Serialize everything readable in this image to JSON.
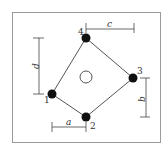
{
  "diagram": {
    "type": "bolt-pattern",
    "frame": {
      "x": 12,
      "y": 12,
      "w": 149,
      "h": 131,
      "stroke": "#9a9a9a"
    },
    "center_hole": {
      "cx": 86,
      "cy": 77,
      "r": 6
    },
    "bolts": [
      {
        "id": "1",
        "label": "1",
        "cx": 52,
        "cy": 94
      },
      {
        "id": "2",
        "label": "2",
        "cx": 86,
        "cy": 117
      },
      {
        "id": "3",
        "label": "3",
        "cx": 133,
        "cy": 78
      },
      {
        "id": "4",
        "label": "4",
        "cx": 86,
        "cy": 38
      }
    ],
    "dimensions": {
      "a": {
        "label": "a"
      },
      "b": {
        "label": "b"
      },
      "c": {
        "label": "c"
      },
      "d": {
        "label": "d"
      }
    },
    "colors": {
      "line": "#555555",
      "bolt": "#111111",
      "dim": "#444444"
    }
  }
}
